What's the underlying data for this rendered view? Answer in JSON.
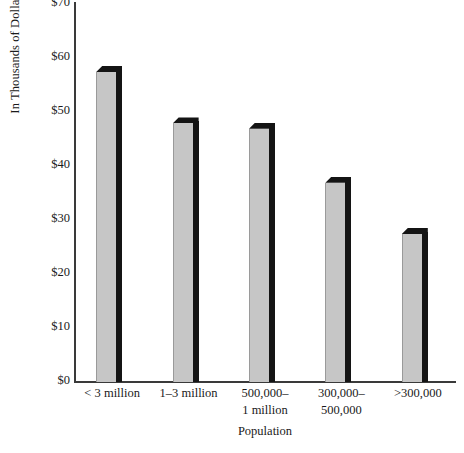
{
  "chart_data": {
    "type": "bar",
    "title": "",
    "xlabel": "Population",
    "ylabel": "In Thousands of Dollars",
    "categories": [
      "< 3 million",
      "1–3 million",
      "500,000–\n1 million",
      "300,000–\n500,000",
      ">300,000"
    ],
    "values": [
      58.5,
      49,
      48,
      38,
      28.5
    ],
    "ylim": [
      0,
      70
    ],
    "yticks": [
      0,
      10,
      20,
      30,
      40,
      50,
      60,
      70
    ],
    "ytick_labels": [
      "$0",
      "$10",
      "$20",
      "$30",
      "$40",
      "$50",
      "$60",
      "$70"
    ],
    "grid": false,
    "legend": false,
    "bar_face_color": "#c6c6c6",
    "bar_shadow_color": "#141414",
    "axis_color": "#3a3a3a",
    "background_color": "#ffffff"
  },
  "axis": {
    "y_title": "In Thousands of Dollars",
    "x_title": "Population"
  },
  "caption": {
    "cropped_text": ""
  }
}
